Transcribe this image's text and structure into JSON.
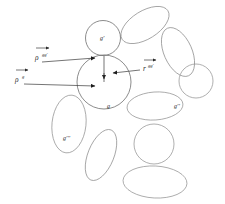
{
  "figure": {
    "background_color": "#ffffff",
    "grain_outline_color": "#8c8c8c",
    "vector_color": "#3a3a3a",
    "label_color": "#2b2b2b",
    "width": 225,
    "height": 204
  },
  "labels": {
    "grain_center": "g",
    "grain_upper": "g'",
    "grain_right": "g''",
    "grain_lower_left": "g'''",
    "vector_rho_gg_base": "ρ",
    "vector_rho_gg_sup": "gg'",
    "vector_rho_g_base": "ρ",
    "vector_rho_g_sup": "g",
    "vector_r_gg_base": "r",
    "vector_r_gg_sup": "gg'"
  },
  "grains": [
    {
      "name": "grain-center-g",
      "shape": "circle",
      "cx": 104,
      "cy": 82,
      "rx": 27,
      "ry": 27,
      "rot": 0
    },
    {
      "name": "grain-upper-g-prime",
      "shape": "circle",
      "cx": 103,
      "cy": 38,
      "rx": 17.5,
      "ry": 17.5,
      "rot": 0
    },
    {
      "name": "grain-top-ellipse",
      "shape": "ellipse",
      "cx": 145,
      "cy": 25,
      "rx": 27,
      "ry": 14,
      "rot": -32
    },
    {
      "name": "grain-upper-right-ellipse",
      "shape": "ellipse",
      "cx": 178,
      "cy": 52,
      "rx": 26,
      "ry": 14,
      "rot": 66
    },
    {
      "name": "grain-right-circle",
      "shape": "circle",
      "cx": 196,
      "cy": 81,
      "rx": 17,
      "ry": 17,
      "rot": 0
    },
    {
      "name": "grain-right-g-double",
      "shape": "ellipse",
      "cx": 155,
      "cy": 106,
      "rx": 28,
      "ry": 14,
      "rot": -4
    },
    {
      "name": "grain-left-g-triple",
      "shape": "ellipse",
      "cx": 69,
      "cy": 124,
      "rx": 17,
      "ry": 29,
      "rot": 6
    },
    {
      "name": "grain-lower-mid-ellipse",
      "shape": "ellipse",
      "cx": 101,
      "cy": 155,
      "rx": 13,
      "ry": 27,
      "rot": 22
    },
    {
      "name": "grain-lower-right-circle",
      "shape": "circle",
      "cx": 154,
      "cy": 144,
      "rx": 20,
      "ry": 20,
      "rot": 0
    },
    {
      "name": "grain-bottom-ellipse",
      "shape": "ellipse",
      "cx": 155,
      "cy": 182,
      "rx": 32,
      "ry": 16,
      "rot": 3
    }
  ],
  "vectors": [
    {
      "name": "vector-rho-gg-prime",
      "from_x": 42,
      "from_y": 62,
      "to_x": 98,
      "to_y": 58
    },
    {
      "name": "vector-rho-g",
      "from_x": 24,
      "from_y": 84,
      "to_x": 98,
      "to_y": 86
    },
    {
      "name": "vector-r-gg-prime",
      "from_x": 140,
      "from_y": 70,
      "to_x": 110,
      "to_y": 73
    },
    {
      "name": "vector-branch-down",
      "from_x": 104,
      "from_y": 55,
      "to_x": 104,
      "to_y": 82
    }
  ]
}
